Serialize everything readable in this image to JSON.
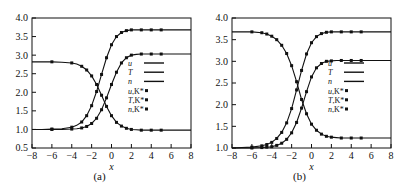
{
  "figure": {
    "background": "#ffffff",
    "ink": "#111111",
    "panel_count": 2
  },
  "panels": [
    {
      "caption": "(a)",
      "chart_ref": 0
    },
    {
      "caption": "(b)",
      "chart_ref": 1
    }
  ],
  "chart_data": [
    {
      "type": "line",
      "title": "",
      "panel_label": "(a)",
      "xlabel": "x",
      "ylabel": "",
      "xlim": [
        -8,
        8
      ],
      "ylim": [
        0.5,
        4.0
      ],
      "xticks": [
        -8,
        -6,
        -4,
        -2,
        0,
        2,
        4,
        6,
        8
      ],
      "xtick_labels": [
        "-8",
        "-6",
        "-4",
        "-2",
        "0",
        "2",
        "4",
        "6",
        "8"
      ],
      "yticks": [
        0.5,
        1.0,
        1.5,
        2.0,
        2.5,
        3.0,
        3.5,
        4.0
      ],
      "ytick_labels": [
        "0.5",
        "1.0",
        "1.5",
        "2.0",
        "2.5",
        "3.0",
        "3.5",
        "4.0"
      ],
      "grid": false,
      "legend_position": "center-right",
      "legend": [
        {
          "label": "u",
          "style": "line"
        },
        {
          "label": "T",
          "style": "line"
        },
        {
          "label": "n",
          "style": "line"
        },
        {
          "label": "u,K*",
          "style": "marker"
        },
        {
          "label": "T,K*",
          "style": "marker"
        },
        {
          "label": "n,K*",
          "style": "marker"
        }
      ],
      "series": [
        {
          "name": "u",
          "style": "line+marker",
          "x": [
            -8,
            -7,
            -6,
            -5,
            -4,
            -3.5,
            -3,
            -2.5,
            -2,
            -1.5,
            -1,
            -0.5,
            0,
            0.5,
            1,
            1.5,
            2,
            2.5,
            3,
            4,
            5,
            6,
            7,
            8
          ],
          "values": [
            2.82,
            2.82,
            2.82,
            2.81,
            2.79,
            2.76,
            2.7,
            2.6,
            2.44,
            2.21,
            1.92,
            1.62,
            1.37,
            1.19,
            1.09,
            1.03,
            1.0,
            0.99,
            0.98,
            0.98,
            0.98,
            0.98,
            0.98,
            0.98
          ],
          "marker_x": [
            -6,
            -4,
            -3,
            -2.5,
            -2,
            -1.5,
            -1,
            -0.5,
            0,
            0.5,
            1,
            1.5,
            2,
            3,
            4,
            5
          ]
        },
        {
          "name": "T",
          "style": "line+marker",
          "x": [
            -8,
            -7,
            -6,
            -5,
            -4,
            -3.5,
            -3,
            -2.5,
            -2,
            -1.5,
            -1,
            -0.5,
            0,
            0.5,
            1,
            1.5,
            2,
            2.5,
            3,
            4,
            5,
            6,
            7,
            8
          ],
          "values": [
            1.0,
            1.0,
            1.01,
            1.02,
            1.06,
            1.11,
            1.2,
            1.37,
            1.64,
            2.02,
            2.48,
            2.93,
            3.28,
            3.5,
            3.61,
            3.66,
            3.68,
            3.68,
            3.68,
            3.68,
            3.68,
            3.68,
            3.68,
            3.68
          ],
          "marker_x": [
            -6,
            -4,
            -3,
            -2.5,
            -2,
            -1.5,
            -1,
            -0.5,
            0,
            0.5,
            1,
            1.5,
            2,
            3,
            4,
            5
          ]
        },
        {
          "name": "n",
          "style": "line+marker",
          "x": [
            -8,
            -7,
            -6,
            -5,
            -4,
            -3.5,
            -3,
            -2.5,
            -2,
            -1.5,
            -1,
            -0.5,
            0,
            0.5,
            1,
            1.5,
            2,
            2.5,
            3,
            4,
            5,
            6,
            7,
            8
          ],
          "values": [
            1.0,
            1.0,
            1.0,
            1.0,
            1.01,
            1.02,
            1.04,
            1.08,
            1.16,
            1.3,
            1.53,
            1.85,
            2.21,
            2.54,
            2.79,
            2.93,
            3.0,
            3.02,
            3.03,
            3.03,
            3.03,
            3.03,
            3.03,
            3.03
          ],
          "marker_x": [
            -6,
            -4,
            -3,
            -2.5,
            -2,
            -1.5,
            -1,
            -0.5,
            0,
            0.5,
            1,
            1.5,
            2,
            3,
            4,
            5
          ]
        }
      ]
    },
    {
      "type": "line",
      "title": "",
      "panel_label": "(b)",
      "xlabel": "x",
      "ylabel": "",
      "xlim": [
        -8,
        8
      ],
      "ylim": [
        1.0,
        4.0
      ],
      "xticks": [
        -8,
        -6,
        -4,
        -2,
        0,
        2,
        4,
        6,
        8
      ],
      "xtick_labels": [
        "-8",
        "-6",
        "-4",
        "-2",
        "0",
        "2",
        "4",
        "6",
        "8"
      ],
      "yticks": [
        1.0,
        1.5,
        2.0,
        2.5,
        3.0,
        3.5,
        4.0
      ],
      "ytick_labels": [
        "1.0",
        "1.5",
        "2.0",
        "2.5",
        "3.0",
        "3.5",
        "4.0"
      ],
      "grid": false,
      "legend_position": "center-right",
      "legend": [
        {
          "label": "u",
          "style": "line"
        },
        {
          "label": "T",
          "style": "line"
        },
        {
          "label": "n",
          "style": "line"
        },
        {
          "label": "u,K*",
          "style": "marker"
        },
        {
          "label": "T,K*",
          "style": "marker"
        },
        {
          "label": "n,K*",
          "style": "marker"
        }
      ],
      "series": [
        {
          "name": "u",
          "style": "line+marker",
          "x": [
            -8,
            -7,
            -6,
            -5,
            -4.5,
            -4,
            -3.5,
            -3,
            -2.5,
            -2,
            -1.5,
            -1,
            -0.5,
            0,
            0.5,
            1,
            1.5,
            2,
            2.5,
            3,
            4,
            5,
            6,
            7,
            8
          ],
          "values": [
            3.68,
            3.68,
            3.68,
            3.66,
            3.63,
            3.58,
            3.5,
            3.37,
            3.18,
            2.9,
            2.53,
            2.12,
            1.79,
            1.55,
            1.41,
            1.32,
            1.27,
            1.25,
            1.24,
            1.23,
            1.23,
            1.23,
            1.23,
            1.23,
            1.23
          ],
          "marker_x": [
            -6,
            -5,
            -4.5,
            -4,
            -3.5,
            -3,
            -2.5,
            -2,
            -1.5,
            -1,
            -0.5,
            0,
            0.5,
            1,
            1.5,
            2,
            3,
            4,
            5
          ]
        },
        {
          "name": "T",
          "style": "line+marker",
          "x": [
            -8,
            -7,
            -6,
            -5,
            -4.5,
            -4,
            -3.5,
            -3,
            -2.5,
            -2,
            -1.5,
            -1,
            -0.5,
            0,
            0.5,
            1,
            1.5,
            2,
            2.5,
            3,
            4,
            5,
            6,
            7,
            8
          ],
          "values": [
            1.0,
            1.01,
            1.02,
            1.05,
            1.08,
            1.13,
            1.22,
            1.36,
            1.58,
            1.91,
            2.34,
            2.79,
            3.17,
            3.43,
            3.57,
            3.64,
            3.67,
            3.68,
            3.68,
            3.68,
            3.68,
            3.68,
            3.68,
            3.68,
            3.68
          ],
          "marker_x": [
            -6,
            -5,
            -4.5,
            -4,
            -3.5,
            -3,
            -2.5,
            -2,
            -1.5,
            -1,
            -0.5,
            0,
            0.5,
            1,
            1.5,
            2,
            3,
            4,
            5
          ]
        },
        {
          "name": "n",
          "style": "line+marker",
          "x": [
            -8,
            -7,
            -6,
            -5,
            -4.5,
            -4,
            -3.5,
            -3,
            -2.5,
            -2,
            -1.5,
            -1,
            -0.5,
            0,
            0.5,
            1,
            1.5,
            2,
            2.5,
            3,
            4,
            5,
            6,
            7,
            8
          ],
          "values": [
            1.0,
            1.0,
            1.0,
            1.01,
            1.02,
            1.03,
            1.06,
            1.11,
            1.2,
            1.35,
            1.59,
            1.92,
            2.3,
            2.64,
            2.85,
            2.95,
            3.0,
            3.01,
            3.02,
            3.02,
            3.02,
            3.02,
            3.02,
            3.02,
            3.02
          ],
          "marker_x": [
            -6,
            -5,
            -4.5,
            -4,
            -3.5,
            -3,
            -2.5,
            -2,
            -1.5,
            -1,
            -0.5,
            0,
            0.5,
            1,
            1.5,
            2,
            3,
            4,
            5
          ]
        }
      ]
    }
  ]
}
